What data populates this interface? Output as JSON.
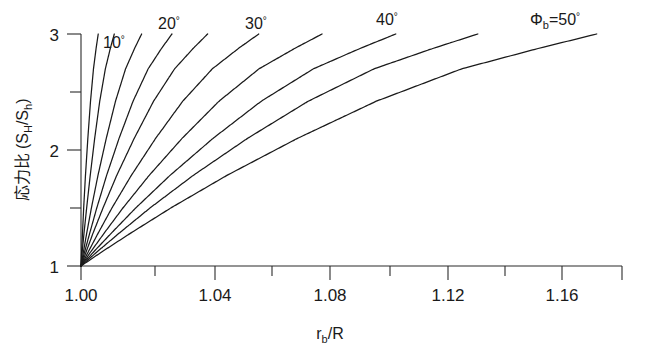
{
  "chart_data": {
    "type": "line",
    "title": "",
    "xlabel": "r_b/R",
    "ylabel": "応力比 (S_H/S_h)",
    "xlim": [
      1.0,
      1.182
    ],
    "ylim": [
      1.0,
      3.0
    ],
    "grid": false,
    "legend_position": "inline-at-curve-tops",
    "x_major_ticks": [
      1.0,
      1.04,
      1.08,
      1.12,
      1.16
    ],
    "x_major_tick_labels": [
      "1.00",
      "1.04",
      "1.08",
      "1.12",
      "1.16"
    ],
    "x_minor_ticks": [
      1.02,
      1.06,
      1.1,
      1.14
    ],
    "y_major_ticks": [
      1,
      2,
      3
    ],
    "y_major_tick_labels": [
      "1",
      "2",
      "3"
    ],
    "y_minor_ticks": [
      1.5,
      2.5
    ],
    "series": [
      {
        "name": "5",
        "label": "",
        "phi_b_deg": 5,
        "x": [
          1.0,
          1.0002,
          1.0005,
          1.0009,
          1.0015,
          1.0023,
          1.0032,
          1.0042,
          1.0051,
          1.0058
        ],
        "values": [
          1.0,
          1.12,
          1.28,
          1.5,
          1.78,
          2.1,
          2.42,
          2.7,
          2.88,
          3.0
        ]
      },
      {
        "name": "10",
        "label": "10°",
        "phi_b_deg": 10,
        "x": [
          1.0,
          1.0004,
          1.001,
          1.0019,
          1.0031,
          1.0046,
          1.0063,
          1.0082,
          1.0099,
          1.0112
        ],
        "values": [
          1.0,
          1.12,
          1.28,
          1.5,
          1.78,
          2.1,
          2.42,
          2.7,
          2.88,
          3.0
        ]
      },
      {
        "name": "15",
        "label": "",
        "phi_b_deg": 15,
        "x": [
          1.0,
          1.0008,
          1.0019,
          1.0035,
          1.0057,
          1.0085,
          1.0116,
          1.015,
          1.0181,
          1.0204
        ],
        "values": [
          1.0,
          1.12,
          1.28,
          1.5,
          1.78,
          2.1,
          2.42,
          2.7,
          2.88,
          3.0
        ]
      },
      {
        "name": "20",
        "label": "20°",
        "phi_b_deg": 20,
        "x": [
          1.0,
          1.0012,
          1.0029,
          1.0053,
          1.0086,
          1.0128,
          1.0175,
          1.0226,
          1.0272,
          1.0306
        ],
        "values": [
          1.0,
          1.12,
          1.28,
          1.5,
          1.78,
          2.1,
          2.42,
          2.7,
          2.88,
          3.0
        ]
      },
      {
        "name": "25",
        "label": "",
        "phi_b_deg": 25,
        "x": [
          1.0,
          1.0017,
          1.004,
          1.0074,
          1.012,
          1.0179,
          1.0244,
          1.0315,
          1.0379,
          1.0426
        ],
        "values": [
          1.0,
          1.12,
          1.28,
          1.5,
          1.78,
          2.1,
          2.42,
          2.7,
          2.88,
          3.0
        ]
      },
      {
        "name": "30",
        "label": "30°",
        "phi_b_deg": 30,
        "x": [
          1.0,
          1.0024,
          1.0057,
          1.0104,
          1.0169,
          1.0251,
          1.0342,
          1.0442,
          1.0532,
          1.0598
        ],
        "values": [
          1.0,
          1.12,
          1.28,
          1.5,
          1.78,
          2.1,
          2.42,
          2.7,
          2.88,
          3.0
        ]
      },
      {
        "name": "35",
        "label": "",
        "phi_b_deg": 35,
        "x": [
          1.0,
          1.0032,
          1.0077,
          1.0141,
          1.0229,
          1.034,
          1.0464,
          1.0599,
          1.0722,
          1.0811
        ],
        "values": [
          1.0,
          1.12,
          1.28,
          1.5,
          1.78,
          2.1,
          2.42,
          2.7,
          2.88,
          3.0
        ]
      },
      {
        "name": "40",
        "label": "40°",
        "phi_b_deg": 40,
        "x": [
          1.0,
          1.0042,
          1.0101,
          1.0184,
          1.0299,
          1.0444,
          1.0606,
          1.0782,
          1.0943,
          1.1059
        ],
        "values": [
          1.0,
          1.12,
          1.28,
          1.5,
          1.78,
          2.1,
          2.42,
          2.7,
          2.88,
          3.0
        ]
      },
      {
        "name": "45",
        "label": "",
        "phi_b_deg": 45,
        "x": [
          1.0,
          1.0053,
          1.0127,
          1.0232,
          1.0377,
          1.056,
          1.0764,
          1.0986,
          1.1189,
          1.1335
        ],
        "values": [
          1.0,
          1.12,
          1.28,
          1.5,
          1.78,
          2.1,
          2.42,
          2.7,
          2.88,
          3.0
        ]
      },
      {
        "name": "50",
        "label": "Φb=50°",
        "phi_b_deg": 50,
        "x": [
          1.0,
          1.0069,
          1.0165,
          1.0302,
          1.049,
          1.0728,
          1.0993,
          1.1281,
          1.1545,
          1.1735
        ],
        "values": [
          1.0,
          1.12,
          1.28,
          1.5,
          1.78,
          2.1,
          2.42,
          2.7,
          2.88,
          3.0
        ]
      }
    ],
    "annotations": [
      {
        "id": "lbl-10",
        "text": "10°",
        "x": 1.009,
        "y": 2.93
      },
      {
        "id": "lbl-20",
        "text": "20°",
        "x": 1.0255,
        "y": 3.12
      },
      {
        "id": "lbl-30",
        "text": "30°",
        "x": 1.0555,
        "y": 3.12
      },
      {
        "id": "lbl-40",
        "text": "40°",
        "x": 1.101,
        "y": 3.16
      },
      {
        "id": "lbl-50",
        "text": "Φb=50°",
        "x": 1.162,
        "y": 3.16
      }
    ]
  },
  "axis": {
    "x_title_main": "r",
    "x_title_sub": "b",
    "x_title_tail": "/R",
    "y_title_prefix": "応力比 (S",
    "y_title_sub1": "H",
    "y_title_mid": "/S",
    "y_title_sub2": "h",
    "y_title_suffix": ")",
    "x_tick_labels": [
      "1.00",
      "1.04",
      "1.08",
      "1.12",
      "1.16"
    ],
    "y_tick_labels": [
      "1",
      "2",
      "3"
    ]
  },
  "labels": {
    "deg10": "10",
    "deg20": "20",
    "deg30": "30",
    "deg40": "40",
    "phi_b": "Φ",
    "phi_sub": "b",
    "phi_eq": "=50",
    "degree_sign": "°"
  },
  "colors": {
    "background": "#ffffff",
    "axis": "#2b2b2b",
    "curve": "#1a1a1a",
    "text": "#1a1a1a"
  }
}
